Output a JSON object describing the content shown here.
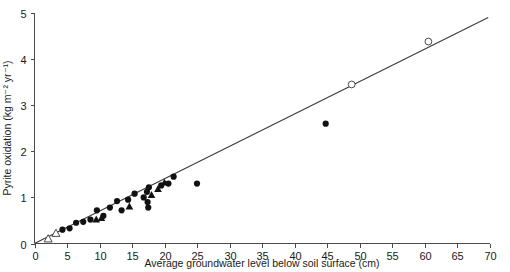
{
  "chart_data": {
    "type": "scatter",
    "title": "",
    "xlabel": "Average groundwater level below soil surface (cm)",
    "ylabel": "Pyrite oxidation (kg m⁻² yr⁻¹)",
    "xlim": [
      0,
      70
    ],
    "ylim": [
      0,
      5
    ],
    "xticks": [
      0,
      5,
      10,
      15,
      20,
      25,
      30,
      35,
      40,
      45,
      50,
      55,
      60,
      65,
      70
    ],
    "yticks": [
      0,
      1,
      2,
      3,
      4,
      5
    ],
    "xtick_labels": [
      "0",
      "5",
      "10",
      "15",
      "20",
      "25",
      "30",
      "35",
      "40",
      "45",
      "50",
      "55",
      "60",
      "65",
      "70"
    ],
    "ytick_labels": [
      "0",
      "1",
      "2",
      "3",
      "4",
      "5"
    ],
    "grid": false,
    "legend": null,
    "series": [
      {
        "name": "filled-circle",
        "marker": "filled-circle",
        "color": "#111111",
        "points": [
          [
            4.3,
            0.3
          ],
          [
            5.4,
            0.33
          ],
          [
            6.4,
            0.45
          ],
          [
            7.5,
            0.47
          ],
          [
            8.6,
            0.52
          ],
          [
            9.6,
            0.72
          ],
          [
            10.6,
            0.6
          ],
          [
            11.6,
            0.78
          ],
          [
            12.7,
            0.92
          ],
          [
            13.4,
            0.72
          ],
          [
            14.4,
            0.95
          ],
          [
            15.4,
            1.08
          ],
          [
            16.8,
            1.0
          ],
          [
            17.3,
            1.12
          ],
          [
            17.4,
            0.9
          ],
          [
            17.5,
            0.78
          ],
          [
            17.6,
            1.22
          ],
          [
            19.5,
            1.26
          ],
          [
            20.6,
            1.3
          ],
          [
            21.4,
            1.45
          ],
          [
            25.0,
            1.3
          ],
          [
            44.8,
            2.6
          ]
        ]
      },
      {
        "name": "filled-triangle",
        "marker": "filled-triangle",
        "color": "#111111",
        "points": [
          [
            9.5,
            0.52
          ],
          [
            10.3,
            0.55
          ],
          [
            14.6,
            0.8
          ],
          [
            18.0,
            1.05
          ],
          [
            19.0,
            1.18
          ],
          [
            20.0,
            1.32
          ]
        ]
      },
      {
        "name": "open-circle",
        "marker": "open-circle",
        "color": "#4a4a4a",
        "points": [
          [
            48.8,
            3.45
          ],
          [
            60.6,
            4.38
          ]
        ]
      },
      {
        "name": "open-triangle",
        "marker": "open-triangle",
        "color": "#4a4a4a",
        "points": [
          [
            2.1,
            0.1
          ],
          [
            3.3,
            0.22
          ]
        ]
      }
    ],
    "fit_line": {
      "name": "regression-line",
      "x0": 0.0,
      "y0": 0.0,
      "x1": 69.8,
      "y1": 4.9,
      "color": "#3a3a3a"
    }
  }
}
